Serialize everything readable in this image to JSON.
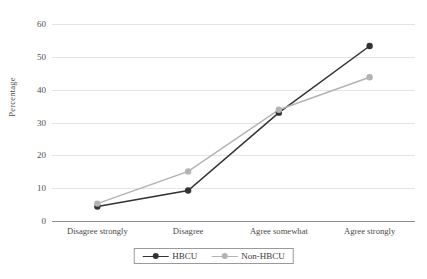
{
  "chart_data": {
    "type": "line",
    "title": "",
    "xlabel": "",
    "ylabel": "Percentage",
    "ylim": [
      0,
      60
    ],
    "yticks": [
      0,
      10,
      20,
      30,
      40,
      50,
      60
    ],
    "ytick_labels": [
      "0",
      "10",
      "20",
      "30",
      "40",
      "50",
      "60"
    ],
    "grid": true,
    "legend_position": "bottom",
    "categories": [
      "Disagree strongly",
      "Disagree",
      "Agree somewhat",
      "Agree strongly"
    ],
    "series": [
      {
        "name": "HBCU",
        "color": "#333333",
        "marker": "circle",
        "values": [
          4.4,
          9.3,
          33.0,
          53.3
        ]
      },
      {
        "name": "Non-HBCU",
        "color": "#b3b3b3",
        "marker": "circle",
        "values": [
          5.3,
          15.1,
          33.9,
          43.8
        ]
      }
    ]
  },
  "legend": {
    "items": [
      {
        "label": "HBCU",
        "color": "#333333"
      },
      {
        "label": "Non-HBCU",
        "color": "#b3b3b3"
      }
    ]
  },
  "axis": {
    "y_title": "Percentage"
  }
}
